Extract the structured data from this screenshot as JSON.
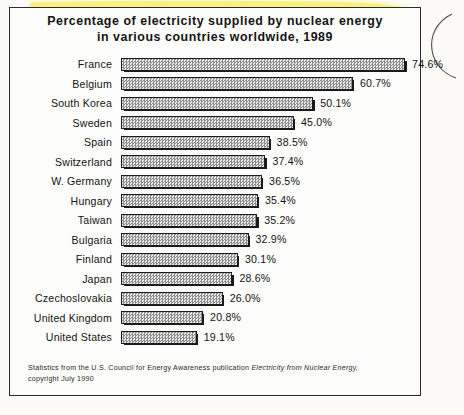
{
  "chart_data": {
    "type": "bar",
    "orientation": "horizontal",
    "title": "Percentage of electricity supplied by nuclear energy in various countries worldwide, 1989",
    "title_line1": "Percentage of electricity supplied by nuclear energy",
    "title_line2": "in various countries worldwide, 1989",
    "xlabel": "",
    "ylabel": "",
    "xlim": [
      0,
      74.6
    ],
    "grid": false,
    "legend": false,
    "value_suffix": "%",
    "categories": [
      "France",
      "Belgium",
      "South Korea",
      "Sweden",
      "Spain",
      "Switzerland",
      "W. Germany",
      "Hungary",
      "Taiwan",
      "Bulgaria",
      "Finland",
      "Japan",
      "Czechoslovakia",
      "United Kingdom",
      "United States"
    ],
    "values": [
      74.6,
      60.7,
      50.1,
      45.0,
      38.5,
      37.4,
      36.5,
      35.4,
      35.2,
      32.9,
      30.1,
      28.6,
      26.0,
      20.8,
      19.1
    ],
    "value_labels": [
      "74.6%",
      "60.7%",
      "50.1%",
      "45.0%",
      "38.5%",
      "37.4%",
      "36.5%",
      "35.4%",
      "35.2%",
      "32.9%",
      "30.1%",
      "28.6%",
      "26.0%",
      "20.8%",
      "19.1%"
    ]
  },
  "source_note": {
    "line1_before": "Statistics from the U.S. Council for Energy Awareness publication ",
    "line1_italic": "Electricity from Nuclear Energy,",
    "line2": "copyright July 1990"
  },
  "annotations": {
    "highlighter_color": "#f2e85c",
    "pen_color": "#3a3a3a",
    "highlighter_shape": "closed-loop-around-chart",
    "pen_shape": "arc-right-margin"
  },
  "colors": {
    "frame_border": "#2b2b2b",
    "bar_fill": "#c9c9c9",
    "bar_border": "#1d1d1d",
    "bar_shadow": "#1a1a1a",
    "text": "#131313",
    "paper": "#fcfbf8"
  }
}
